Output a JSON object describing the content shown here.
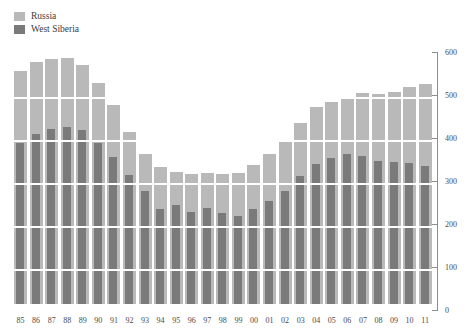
{
  "legend": {
    "position": "top-left",
    "items": [
      {
        "label": "Russia",
        "color": "#b9b9b9"
      },
      {
        "label": "West Siberia",
        "color": "#7a7a7a"
      }
    ]
  },
  "axes": {
    "y": {
      "min": 0,
      "max": 600,
      "step": 100,
      "position": "right",
      "ticks": [
        0,
        100,
        200,
        300,
        400,
        500,
        600
      ],
      "tick_labels": [
        "0",
        "100",
        "200",
        "300",
        "400",
        "500",
        "600"
      ]
    },
    "x": {
      "tick_labels": [
        "85",
        "86",
        "87",
        "88",
        "89",
        "90",
        "91",
        "92",
        "93",
        "94",
        "95",
        "96",
        "97",
        "98",
        "99",
        "00",
        "01",
        "02",
        "03",
        "04",
        "05",
        "06",
        "07",
        "08",
        "09",
        "10",
        "11"
      ]
    },
    "grid": "horizontal-white-overlay"
  },
  "colors": {
    "background": "#ffffff",
    "russia": "#b9b9b9",
    "west_siberia": "#7a7a7a",
    "axis": "#8d8d8d",
    "text": "#4a4a4a",
    "gridline": "#ffffff"
  },
  "chart_data": {
    "type": "bar",
    "title": "",
    "subtitle": "",
    "xlabel": "",
    "ylabel": "",
    "ylim": [
      0,
      600
    ],
    "grid": true,
    "legend_position": "top-left",
    "categories": [
      "85",
      "86",
      "87",
      "88",
      "89",
      "90",
      "91",
      "92",
      "93",
      "94",
      "95",
      "96",
      "97",
      "98",
      "99",
      "00",
      "01",
      "02",
      "03",
      "04",
      "05",
      "06",
      "07",
      "08",
      "09",
      "10",
      "11"
    ],
    "series": [
      {
        "name": "Russia",
        "color": "#b9b9b9",
        "values": [
          542,
          562,
          570,
          572,
          555,
          515,
          462,
          400,
          350,
          318,
          307,
          302,
          305,
          303,
          305,
          323,
          348,
          380,
          421,
          459,
          470,
          481,
          491,
          488,
          494,
          505,
          511
        ]
      },
      {
        "name": "West Siberia",
        "color": "#7a7a7a",
        "values": [
          375,
          395,
          408,
          412,
          405,
          375,
          341,
          299,
          262,
          222,
          230,
          214,
          223,
          211,
          205,
          222,
          240,
          263,
          297,
          325,
          340,
          348,
          345,
          332,
          330,
          327,
          320
        ]
      }
    ],
    "annotations": []
  }
}
